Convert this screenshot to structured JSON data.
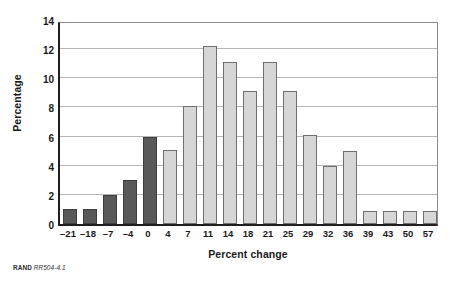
{
  "figure": {
    "source_note_label": "RAND",
    "source_note_id": "RR504-4.1"
  },
  "chart_data": {
    "type": "bar",
    "title": "",
    "xlabel": "Percent change",
    "ylabel": "Percentage",
    "categories": [
      "–21",
      "–18",
      "–7",
      "–4",
      "0",
      "4",
      "7",
      "11",
      "14",
      "18",
      "21",
      "25",
      "29",
      "32",
      "36",
      "39",
      "43",
      "50",
      "57"
    ],
    "values": [
      1.0,
      1.0,
      2.0,
      3.0,
      6.0,
      5.1,
      8.1,
      12.2,
      11.1,
      9.1,
      11.1,
      9.1,
      6.1,
      4.0,
      5.0,
      0.9,
      0.9,
      0.9,
      0.9
    ],
    "bar_colors": [
      "dark",
      "dark",
      "dark",
      "dark",
      "dark",
      "light",
      "light",
      "light",
      "light",
      "light",
      "light",
      "light",
      "light",
      "light",
      "light",
      "light",
      "light",
      "light",
      "light"
    ],
    "ylim": [
      0,
      14
    ],
    "yticks": [
      0,
      2,
      4,
      6,
      8,
      10,
      12,
      14
    ],
    "ytick_labels": [
      "0",
      "2",
      "4",
      "6",
      "8",
      "10",
      "12",
      "14"
    ],
    "grid": true,
    "grid_axis": "y",
    "legend": null,
    "colors": {
      "dark_bar": "#595959",
      "dark_bar_border": "#3d3d3d",
      "light_bar": "#d6d6d6",
      "light_bar_border": "#6e6e6e",
      "gridline": "#b5b5b5",
      "axis": "#1f1f1f",
      "text": "#1a1a1a"
    }
  }
}
